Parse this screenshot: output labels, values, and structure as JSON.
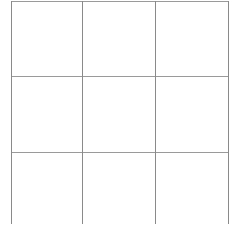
{
  "grid": {
    "rows": 3,
    "columns": 3,
    "line_color": "#8a8a8a",
    "background": "#ffffff",
    "vertical_lines_x": [
      11,
      82,
      155,
      228
    ],
    "horizontal_lines_y": [
      1,
      76,
      152
    ],
    "top": 1,
    "bottom": 224
  }
}
